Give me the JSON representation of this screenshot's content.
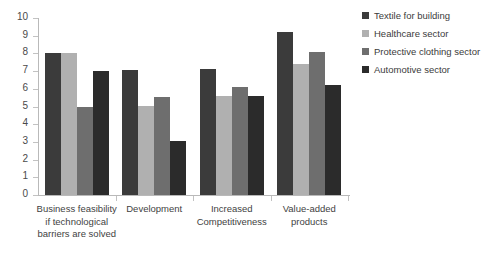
{
  "chart_data": {
    "type": "bar",
    "title": "",
    "subtitle": "",
    "xlabel": "",
    "ylabel": "",
    "ylim": [
      0,
      10
    ],
    "ytick_step": 1,
    "yticks": [
      "10",
      "9",
      "8",
      "7",
      "6",
      "5",
      "4",
      "3",
      "2",
      "1",
      "0"
    ],
    "grid": false,
    "legend_position": "top-right",
    "categories": [
      "Business feasibility\nif technological\nbarriers are solved",
      "Development",
      "Increased\nCompetitiveness",
      "Value-added\nproducts"
    ],
    "series": [
      {
        "name": "Textile for building",
        "color": "#3b3b3b",
        "values": [
          8.0,
          7.05,
          7.1,
          9.2
        ]
      },
      {
        "name": "Healthcare sector",
        "color": "#b0b0b0",
        "values": [
          8.0,
          5.05,
          5.6,
          7.4
        ]
      },
      {
        "name": "Protective clothing sector",
        "color": "#6e6e6e",
        "values": [
          5.0,
          5.55,
          6.1,
          8.1
        ]
      },
      {
        "name": "Automotive sector",
        "color": "#2b2b2b",
        "values": [
          7.0,
          3.05,
          5.6,
          6.2
        ]
      }
    ]
  },
  "axis": {
    "line_color": "#b9b9b9",
    "tick_color": "#c2c2c2"
  }
}
